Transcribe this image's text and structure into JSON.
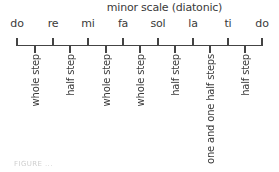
{
  "diagram": {
    "title": "minor scale (diatonic)",
    "notes": [
      {
        "label": "do",
        "x": 17
      },
      {
        "label": "re",
        "x": 53
      },
      {
        "label": "mi",
        "x": 88
      },
      {
        "label": "fa",
        "x": 123
      },
      {
        "label": "sol",
        "x": 158
      },
      {
        "label": "la",
        "x": 193
      },
      {
        "label": "ti",
        "x": 228
      },
      {
        "label": "do",
        "x": 262
      }
    ],
    "intervals": [
      {
        "label": "whole step",
        "x": 35
      },
      {
        "label": "half step",
        "x": 70
      },
      {
        "label": "whole step",
        "x": 106
      },
      {
        "label": "whole step",
        "x": 140
      },
      {
        "label": "half step",
        "x": 175
      },
      {
        "label": "one and one half steps",
        "x": 210
      },
      {
        "label": "half step",
        "x": 245
      }
    ],
    "caption": "FIGURE ..."
  },
  "colors": {
    "line": "#444444",
    "text": "#3a3a3a",
    "background": "#ffffff"
  }
}
